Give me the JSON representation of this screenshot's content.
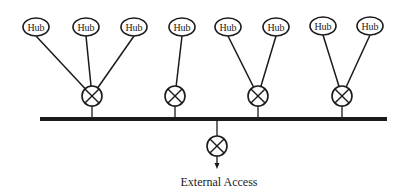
{
  "diagram": {
    "hub_label": "Hub",
    "external_label": "External Access",
    "colors": {
      "stroke": "#1a1a1a",
      "fill": "#ffffff"
    },
    "bus": {
      "x1": 40,
      "x2": 387,
      "y": 119,
      "thickness": 4
    },
    "switches": [
      {
        "id": "switch-1",
        "cx": 92,
        "cy": 96,
        "hubs": [
          0,
          1,
          2
        ]
      },
      {
        "id": "switch-2",
        "cx": 175,
        "cy": 96,
        "hubs": [
          3
        ]
      },
      {
        "id": "switch-3",
        "cx": 258,
        "cy": 96,
        "hubs": [
          4,
          5
        ]
      },
      {
        "id": "switch-4",
        "cx": 342,
        "cy": 96,
        "hubs": [
          6,
          7
        ]
      }
    ],
    "hubs": [
      {
        "cx": 36,
        "cy": 27
      },
      {
        "cx": 86,
        "cy": 27
      },
      {
        "cx": 134,
        "cy": 27
      },
      {
        "cx": 182,
        "cy": 27
      },
      {
        "cx": 228,
        "cy": 27
      },
      {
        "cx": 276,
        "cy": 27
      },
      {
        "cx": 323,
        "cy": 26
      },
      {
        "cx": 370,
        "cy": 26
      }
    ],
    "external_switch": {
      "cx": 217,
      "cy": 146
    }
  }
}
